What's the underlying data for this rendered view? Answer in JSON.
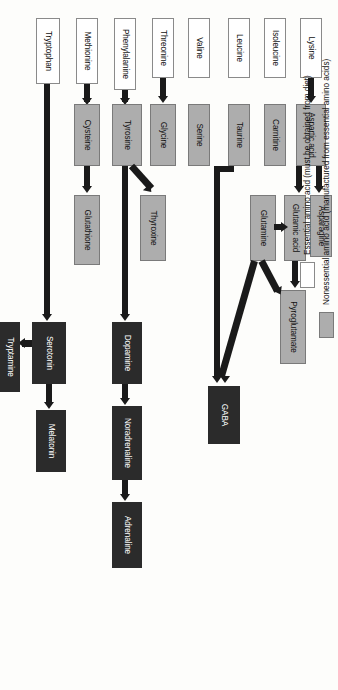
{
  "diagram": {
    "colors": {
      "essential": "#ffffff",
      "nonessential": "#adadad",
      "neurotransmitter": "#2b2b2b",
      "arrow": "#1a1a1a",
      "background": "#fdfdfb"
    },
    "nodes": {
      "lysine": "Lysine",
      "isoleucine": "Isoleucine",
      "leucine": "Leucine",
      "valine": "Valine",
      "threonine": "Threonine",
      "phenylalanine": "Phenylalanine",
      "methionine": "Methionine",
      "tryptophan": "Tryptophan",
      "aspartic_acid": "Aspartic acid",
      "carnitine": "Carnitine",
      "taurine": "Taurine",
      "serine": "Serine",
      "glycine": "Glycine",
      "tyrosine": "Tyrosine",
      "cysteine": "Cysteine",
      "asparagine": "Asparagine",
      "glutamic_acid": "Glutamic acid",
      "glutamine": "Glutamine",
      "thyroxine": "Thyroxine",
      "glutathione": "Glutathione",
      "pyroglutamate": "Pyroglutamate",
      "gaba": "GABA",
      "dopamine": "Dopamine",
      "noradrenaline": "Noradrenaline",
      "adrenaline": "Adrenaline",
      "serotonin": "Serotonin",
      "melatonin": "Melatonin",
      "tryptamine": "Tryptamine"
    },
    "edges": [
      {
        "from": "Lysine",
        "to": "Aspartic acid"
      },
      {
        "from": "Aspartic acid",
        "to": "Asparagine"
      },
      {
        "from": "Aspartic acid",
        "to": "Glutamic acid"
      },
      {
        "from": "Glutamic acid",
        "to": "Pyroglutamate"
      },
      {
        "from": "Glutamine",
        "to": "Glutamic acid"
      },
      {
        "from": "Glutamine",
        "to": "Pyroglutamate"
      },
      {
        "from": "Glutamine",
        "to": "GABA"
      },
      {
        "from": "Taurine",
        "to": "GABA"
      },
      {
        "from": "Threonine",
        "to": "Glycine"
      },
      {
        "from": "Phenylalanine",
        "to": "Tyrosine"
      },
      {
        "from": "Tyrosine",
        "to": "Thyroxine"
      },
      {
        "from": "Tyrosine",
        "to": "Dopamine"
      },
      {
        "from": "Dopamine",
        "to": "Noradrenaline"
      },
      {
        "from": "Noradrenaline",
        "to": "Adrenaline"
      },
      {
        "from": "Methionine",
        "to": "Cysteine"
      },
      {
        "from": "Cysteine",
        "to": "Glutathione"
      },
      {
        "from": "Tryptophan",
        "to": "Serotonin"
      },
      {
        "from": "Serotonin",
        "to": "Melatonin"
      },
      {
        "from": "Serotonin",
        "to": "Tryptamine"
      }
    ]
  },
  "legend": {
    "items": [
      {
        "key": "essential",
        "label": "Essential amino acid (must be obtained from diet)"
      },
      {
        "key": "nonessential",
        "label": "Nonessential amino acid (manufactured from essential amino acids)"
      },
      {
        "key": "neurotransmitter",
        "label": "Neurotransmitter"
      }
    ]
  }
}
